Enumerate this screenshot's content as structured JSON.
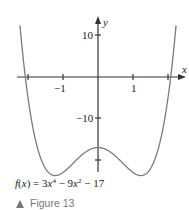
{
  "chart_data": {
    "type": "line",
    "title": "",
    "function": "f(x) = 3x^4 - 9x^2 - 17",
    "xlabel": "x",
    "ylabel": "y",
    "x_ticks": [
      -2,
      -1,
      1,
      2
    ],
    "x_tick_labels": [
      "-1",
      "1"
    ],
    "y_ticks": [
      10,
      -10,
      -20
    ],
    "y_tick_labels": [
      "10",
      "-10"
    ],
    "xlim": [
      -2.3,
      2.4
    ],
    "ylim": [
      -25,
      14
    ],
    "grid": false,
    "key_points": [
      {
        "x": 0,
        "y": -17,
        "note": "local max"
      },
      {
        "x": -1.22,
        "y": -23.75,
        "note": "local min"
      },
      {
        "x": 1.22,
        "y": -23.75,
        "note": "local min"
      },
      {
        "x": -2.08,
        "y": 0,
        "note": "x-intercept"
      },
      {
        "x": 2.08,
        "y": 0,
        "note": "x-intercept"
      }
    ]
  },
  "labels": {
    "x_axis": "x",
    "y_axis": "y",
    "tick_neg1": "−1",
    "tick_pos1": "1",
    "tick_10": "10",
    "tick_neg10": "−10"
  },
  "caption": {
    "f": "f",
    "paren_open": "(",
    "x": "x",
    "eq": ") = 3",
    "x2": "x",
    "exp4": "4",
    "minus9": " − 9",
    "x3": "x",
    "exp2": "2",
    "tail": " − 17"
  },
  "figure_label": "Figure 13",
  "colors": {
    "axis": "#333333",
    "curve": "#777777",
    "figure_label": "#777777"
  }
}
